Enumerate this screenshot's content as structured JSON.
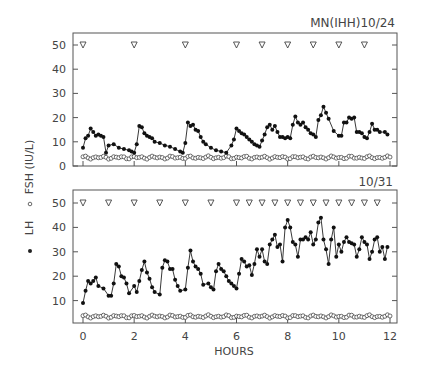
{
  "chart_data": [
    {
      "type": "line",
      "panel": "top",
      "title": "MN(IHH)10/24",
      "xlabel": "HOURS",
      "ylabel": "• LH  ∘ FSH (IU/L)",
      "xlim": [
        0,
        12
      ],
      "ylim": [
        0,
        50
      ],
      "yticks": [
        0,
        10,
        20,
        30,
        40,
        50
      ],
      "xticks": [
        0,
        2,
        4,
        6,
        8,
        10,
        12
      ],
      "grid": false,
      "pulse_markers": {
        "symbol": "▽",
        "y": 50,
        "x": [
          0,
          2,
          4,
          6,
          7,
          8,
          9,
          10,
          11
        ]
      },
      "series": [
        {
          "name": "LH",
          "marker": "filled-circle",
          "x": [
            0,
            0.1,
            0.2,
            0.3,
            0.4,
            0.5,
            0.6,
            0.7,
            0.8,
            0.9,
            1.0,
            1.2,
            1.4,
            1.6,
            1.8,
            1.9,
            2.0,
            2.1,
            2.2,
            2.3,
            2.4,
            2.5,
            2.6,
            2.7,
            2.8,
            3.0,
            3.2,
            3.4,
            3.6,
            3.8,
            3.9,
            4.0,
            4.1,
            4.2,
            4.3,
            4.4,
            4.5,
            4.6,
            4.7,
            4.8,
            5.0,
            5.2,
            5.4,
            5.6,
            5.8,
            5.9,
            6.0,
            6.1,
            6.2,
            6.3,
            6.4,
            6.5,
            6.6,
            6.7,
            6.8,
            6.9,
            7.0,
            7.1,
            7.2,
            7.3,
            7.4,
            7.5,
            7.6,
            7.7,
            7.8,
            7.9,
            8.0,
            8.1,
            8.2,
            8.3,
            8.4,
            8.5,
            8.6,
            8.7,
            8.8,
            8.9,
            9.0,
            9.1,
            9.2,
            9.3,
            9.4,
            9.5,
            9.6,
            9.8,
            10.0,
            10.1,
            10.2,
            10.3,
            10.4,
            10.5,
            10.6,
            10.7,
            10.8,
            10.9,
            11.0,
            11.1,
            11.2,
            11.3,
            11.4,
            11.5,
            11.6,
            11.8,
            11.9
          ],
          "y": [
            7.5,
            11.5,
            12.5,
            15.5,
            14,
            12.5,
            13,
            12.5,
            12,
            5.5,
            8.5,
            9,
            7.5,
            7,
            6.5,
            6,
            5.5,
            9,
            16.5,
            16,
            13.5,
            12.5,
            12,
            11.5,
            10,
            9.5,
            8.5,
            8,
            7,
            6,
            5.5,
            9.5,
            18,
            16.5,
            17,
            15,
            14.5,
            12,
            10,
            9,
            7.5,
            6.5,
            6,
            5.5,
            8.5,
            11,
            15.5,
            14.5,
            13.5,
            13,
            12,
            11,
            10,
            9,
            8.5,
            8,
            10.5,
            13,
            16,
            17,
            15,
            16.5,
            14,
            12,
            12,
            11.5,
            12,
            11.5,
            17,
            20.5,
            18,
            17,
            18,
            16,
            15,
            13.5,
            13,
            12,
            19,
            21,
            24.5,
            22,
            19.5,
            14.5,
            12.5,
            12.5,
            18,
            18,
            20,
            19.5,
            20,
            14,
            14,
            13.5,
            12,
            11.5,
            14,
            17.5,
            15,
            15,
            14,
            14,
            13,
            11,
            10.5
          ]
        },
        {
          "name": "FSH",
          "marker": "open-circle",
          "approx_constant": 3.5,
          "range": [
            3,
            4.5
          ]
        }
      ]
    },
    {
      "type": "line",
      "panel": "bottom",
      "title": "10/31",
      "xlabel": "HOURS",
      "xlim": [
        0,
        12
      ],
      "ylim": [
        0,
        50
      ],
      "yticks": [
        10,
        20,
        30,
        40,
        50
      ],
      "xticks": [
        0,
        2,
        4,
        6,
        8,
        10,
        12
      ],
      "grid": false,
      "pulse_markers": {
        "symbol": "▽",
        "y": 50,
        "x": [
          0,
          1,
          2,
          3,
          4,
          5,
          6,
          6.5,
          7,
          7.5,
          8,
          8.5,
          9,
          9.5,
          10,
          10.5,
          11,
          11.5
        ]
      },
      "series": [
        {
          "name": "LH",
          "marker": "filled-circle",
          "x": [
            0,
            0.1,
            0.2,
            0.3,
            0.4,
            0.5,
            0.6,
            0.8,
            1.0,
            1.1,
            1.2,
            1.3,
            1.4,
            1.5,
            1.6,
            1.7,
            1.8,
            2.0,
            2.1,
            2.2,
            2.3,
            2.4,
            2.5,
            2.6,
            2.7,
            2.8,
            3.0,
            3.1,
            3.2,
            3.3,
            3.4,
            3.5,
            3.6,
            3.7,
            3.8,
            4.0,
            4.1,
            4.2,
            4.3,
            4.4,
            4.5,
            4.6,
            4.7,
            4.9,
            5.0,
            5.1,
            5.2,
            5.3,
            5.4,
            5.5,
            5.6,
            5.7,
            5.8,
            5.9,
            6.0,
            6.1,
            6.2,
            6.3,
            6.4,
            6.5,
            6.6,
            6.7,
            6.8,
            6.9,
            7.0,
            7.1,
            7.2,
            7.3,
            7.4,
            7.5,
            7.6,
            7.7,
            7.8,
            7.9,
            8.0,
            8.1,
            8.2,
            8.3,
            8.4,
            8.5,
            8.6,
            8.7,
            8.8,
            8.9,
            9.0,
            9.1,
            9.2,
            9.3,
            9.4,
            9.5,
            9.6,
            9.7,
            9.8,
            9.9,
            10.0,
            10.1,
            10.2,
            10.3,
            10.4,
            10.5,
            10.6,
            10.7,
            10.8,
            10.9,
            11.0,
            11.1,
            11.2,
            11.3,
            11.4,
            11.5,
            11.6,
            11.7,
            11.8,
            11.9
          ],
          "y": [
            9,
            14,
            18,
            17,
            18,
            19.5,
            16,
            15,
            12,
            12,
            17,
            25,
            24,
            20,
            19.5,
            17,
            13,
            16,
            13.5,
            18,
            22.5,
            26,
            21.5,
            19,
            15.5,
            13.5,
            12.5,
            23.5,
            26.5,
            26,
            23,
            23,
            18.5,
            16,
            14,
            14.5,
            23.5,
            30.5,
            26,
            24,
            23,
            21,
            16.5,
            17,
            15.5,
            14.5,
            22,
            25,
            23,
            22,
            20,
            18,
            17,
            16,
            15,
            21,
            27,
            26,
            24,
            24.5,
            20.5,
            25,
            31,
            28,
            31,
            26,
            25,
            33,
            35,
            37,
            32,
            33,
            26,
            40,
            43,
            40,
            34,
            33,
            28,
            35,
            35,
            36,
            35,
            38,
            33,
            35,
            42,
            44,
            35,
            31,
            25,
            35,
            40,
            28,
            33,
            30,
            34,
            36,
            34,
            33.5,
            33,
            28,
            31,
            36,
            34,
            33,
            27,
            30,
            35,
            36,
            30,
            32,
            27,
            32,
            40,
            40,
            41,
            34,
            30,
            27,
            35,
            40,
            38,
            36,
            35
          ]
        },
        {
          "name": "FSH",
          "marker": "open-circle",
          "approx_constant": 3.5,
          "range": [
            2.5,
            4.5
          ]
        }
      ]
    }
  ],
  "labels": {
    "top_title": "MN(IHH)10/24",
    "bottom_title": "10/31",
    "xlabel": "HOURS",
    "ylabel_fsh": "FSH (IU/L)",
    "ylabel_lh": "LH",
    "legend_open": "∘",
    "legend_filled": "•",
    "yticks_top": [
      "50",
      "40",
      "30",
      "20",
      "10",
      "0"
    ],
    "yticks_bottom": [
      "50",
      "40",
      "30",
      "20",
      "10"
    ],
    "xticks": [
      "0",
      "2",
      "4",
      "6",
      "8",
      "10",
      "12"
    ]
  }
}
